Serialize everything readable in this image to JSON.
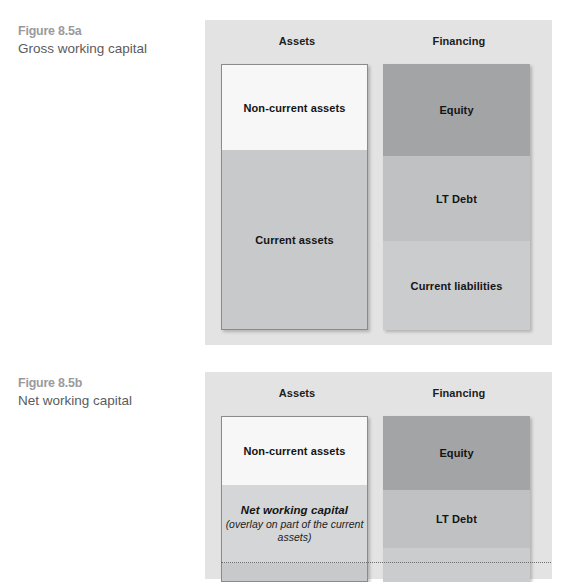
{
  "figures": [
    {
      "id": "fig-a",
      "caption_number": "Figure 8.5a",
      "caption_text": "Gross working capital",
      "columns": [
        {
          "title": "Assets",
          "segments": [
            {
              "label": "Non-current assets",
              "color": "#f7f7f7"
            },
            {
              "label": "Current assets",
              "color": "#c8c9ca"
            }
          ]
        },
        {
          "title": "Financing",
          "segments": [
            {
              "label": "Equity",
              "color": "#a3a4a5"
            },
            {
              "label": "LT Debt",
              "color": "#c0c1c2"
            },
            {
              "label": "Current liabilities",
              "color": "#cbcccd"
            }
          ]
        }
      ]
    },
    {
      "id": "fig-b",
      "caption_number": "Figure 8.5b",
      "caption_text": "Net working capital",
      "columns": [
        {
          "title": "Assets",
          "segments": [
            {
              "label": "Non-current assets",
              "color": "#f7f7f7"
            },
            {
              "label": "Net working capital",
              "sublabel": "(overlay on part of the current assets)",
              "color": "#d5d6d7"
            },
            {
              "label": "",
              "color": "#c8c9ca"
            }
          ]
        },
        {
          "title": "Financing",
          "segments": [
            {
              "label": "Equity",
              "color": "#a3a4a5"
            },
            {
              "label": "LT Debt",
              "color": "#c0c1c2"
            },
            {
              "label": "",
              "color": "#cbcccd"
            }
          ]
        }
      ]
    }
  ],
  "colors": {
    "panel_background": "#e3e3e3",
    "caption_number": "#9a9a9c",
    "caption_text": "#5b5b5d",
    "dotted_line": "#6d6d6d"
  }
}
